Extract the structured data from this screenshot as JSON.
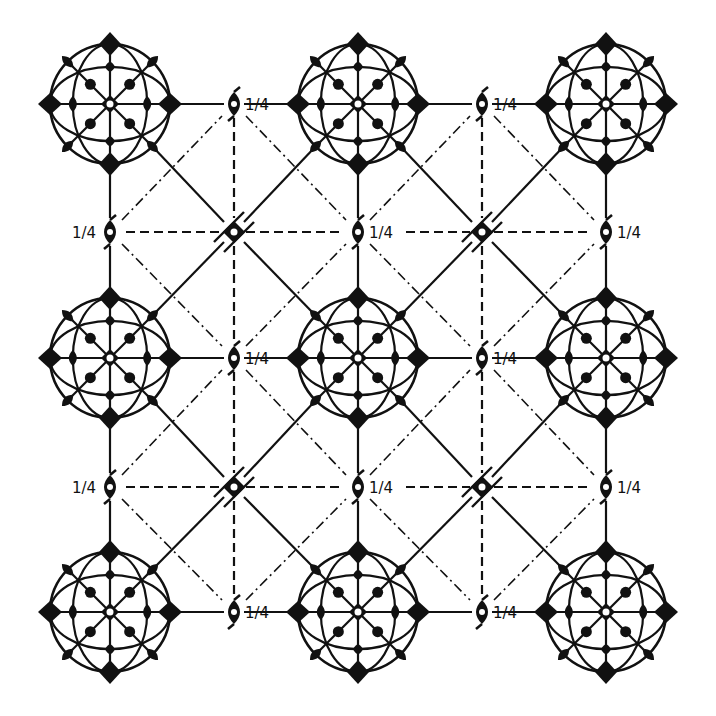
{
  "colors": {
    "ink": "#111111",
    "background": "#ffffff"
  },
  "grid": {
    "cols": [
      110,
      234,
      358,
      482,
      606
    ],
    "rows": [
      104,
      232,
      358,
      487,
      612
    ]
  },
  "legend_label": "1/4",
  "cubic_sites": [
    {
      "c": 0,
      "r": 0
    },
    {
      "c": 2,
      "r": 0
    },
    {
      "c": 4,
      "r": 0
    },
    {
      "c": 0,
      "r": 2
    },
    {
      "c": 2,
      "r": 2
    },
    {
      "c": 4,
      "r": 2
    },
    {
      "c": 0,
      "r": 4
    },
    {
      "c": 2,
      "r": 4
    },
    {
      "c": 4,
      "r": 4
    }
  ],
  "screw_axes_quarter": [
    {
      "c": 1,
      "r": 0,
      "label": "1/4",
      "side": "right"
    },
    {
      "c": 3,
      "r": 0,
      "label": "1/4",
      "side": "right"
    },
    {
      "c": 0,
      "r": 1,
      "label": "1/4",
      "side": "left"
    },
    {
      "c": 2,
      "r": 1,
      "label": "1/4",
      "side": "right"
    },
    {
      "c": 4,
      "r": 1,
      "label": "1/4",
      "side": "right"
    },
    {
      "c": 1,
      "r": 2,
      "label": "1/4",
      "side": "right"
    },
    {
      "c": 3,
      "r": 2,
      "label": "1/4",
      "side": "right"
    },
    {
      "c": 0,
      "r": 3,
      "label": "1/4",
      "side": "left"
    },
    {
      "c": 2,
      "r": 3,
      "label": "1/4",
      "side": "right"
    },
    {
      "c": 4,
      "r": 3,
      "label": "1/4",
      "side": "right"
    },
    {
      "c": 1,
      "r": 4,
      "label": "1/4",
      "side": "right"
    },
    {
      "c": 3,
      "r": 4,
      "label": "1/4",
      "side": "right"
    }
  ],
  "inversion_fourfold_sites": [
    {
      "c": 1,
      "r": 1
    },
    {
      "c": 3,
      "r": 1
    },
    {
      "c": 1,
      "r": 3
    },
    {
      "c": 3,
      "r": 3
    }
  ]
}
